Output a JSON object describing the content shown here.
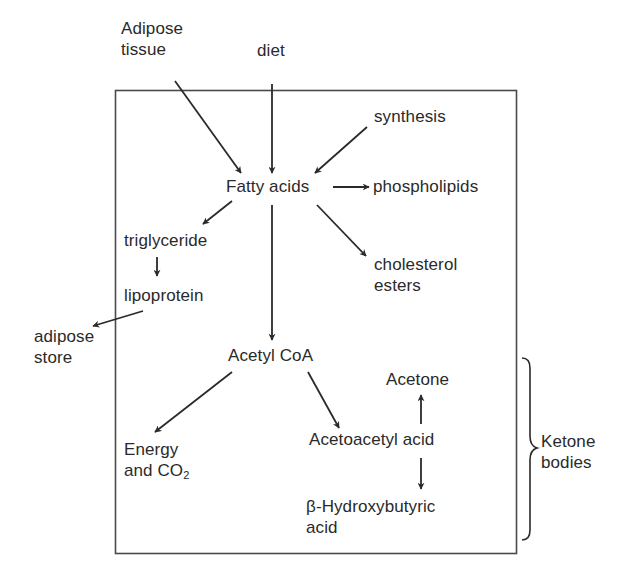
{
  "diagram": {
    "nodes": {
      "adipose_tissue": {
        "lines": [
          "Adipose",
          "tissue"
        ]
      },
      "diet": {
        "label": "diet"
      },
      "synthesis": {
        "label": "synthesis"
      },
      "fatty_acids": {
        "label": "Fatty acids"
      },
      "phospholipids": {
        "label": "phospholipids"
      },
      "triglyceride": {
        "label": "triglyceride"
      },
      "cholesterol_esters": {
        "lines": [
          "cholesterol",
          "esters"
        ]
      },
      "lipoprotein": {
        "label": "lipoprotein"
      },
      "adipose_store": {
        "lines": [
          "adipose",
          "store"
        ]
      },
      "acetyl_coa": {
        "label": "Acetyl CoA"
      },
      "acetone": {
        "label": "Acetone"
      },
      "energy_co2": {
        "line1": "Energy",
        "line2_prefix": "and CO",
        "line2_sub": "2"
      },
      "acetoacetyl_acid": {
        "label": "Acetoacetyl acid"
      },
      "hydroxybutyric_acid": {
        "lines": [
          "β-Hydroxybutyric",
          "acid"
        ]
      },
      "ketone_bodies": {
        "lines": [
          "Ketone",
          "bodies"
        ]
      }
    },
    "edges": [
      {
        "from": "Adipose tissue",
        "to": "Fatty acids"
      },
      {
        "from": "diet",
        "to": "Fatty acids"
      },
      {
        "from": "synthesis",
        "to": "Fatty acids"
      },
      {
        "from": "Fatty acids",
        "to": "phospholipids"
      },
      {
        "from": "Fatty acids",
        "to": "triglyceride"
      },
      {
        "from": "Fatty acids",
        "to": "cholesterol esters"
      },
      {
        "from": "Fatty acids",
        "to": "Acetyl CoA"
      },
      {
        "from": "triglyceride",
        "to": "lipoprotein"
      },
      {
        "from": "lipoprotein",
        "to": "adipose store"
      },
      {
        "from": "Acetyl CoA",
        "to": "Energy and CO2"
      },
      {
        "from": "Acetyl CoA",
        "to": "Acetoacetyl acid"
      },
      {
        "from": "Acetoacetyl acid",
        "to": "Acetone"
      },
      {
        "from": "Acetoacetyl acid",
        "to": "β-Hydroxybutyric acid"
      }
    ],
    "brace_group": {
      "label": "Ketone bodies",
      "members": [
        "Acetone",
        "Acetoacetyl acid",
        "β-Hydroxybutyric acid"
      ]
    },
    "colors": {
      "ink": "#2a2a2a",
      "box_border": "#4a4a4a",
      "background": "#ffffff"
    }
  }
}
